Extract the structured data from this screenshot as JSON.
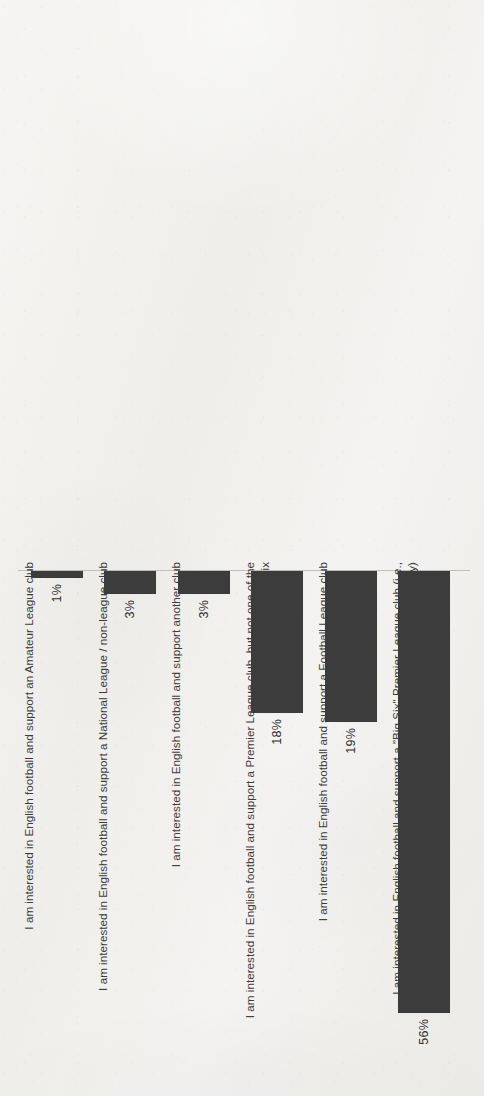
{
  "chart_data": {
    "type": "bar",
    "title": "",
    "subtitle": "",
    "xlabel": "",
    "ylabel": "",
    "orientation": "vertical-rotated-90ccw",
    "grid": false,
    "legend": null,
    "axis_range": [
      0,
      60
    ],
    "value_suffix": "%",
    "categories": [
      "I am interested in English football and support an Amateur League club",
      "I am interested in English football and support a National League / non-league club",
      "I am interested in English football and support another club",
      "I am interested in English football and support a Premier League club, but not one of the Big Six",
      "I am interested in English football and support a Football League club",
      "I am interested in English football and support a \"Big Six\" Premier League club (i.e., Manchester United, Liverpool, Arsenal, Chelsea, Tottenham, Manchester City)"
    ],
    "values": [
      1,
      3,
      3,
      18,
      19,
      56
    ],
    "value_labels": [
      "1%",
      "3%",
      "3%",
      "18%",
      "19%",
      "56%"
    ],
    "colors": {
      "bar_fill": "#3c3c3c",
      "axis_line": "#c0bfbc",
      "text": "#3b3b3b",
      "background": "#f2f1ee"
    }
  },
  "bars": [
    {
      "index": 0,
      "label": "I am interested in English football and support an Amateur League club",
      "value": 1,
      "value_label": "1%",
      "left": 31,
      "width": 52,
      "length": 7
    },
    {
      "index": 1,
      "label": "I am interested in English football and support a National League / non-league club",
      "value": 3,
      "value_label": "3%",
      "left": 104,
      "width": 52,
      "length": 23
    },
    {
      "index": 2,
      "label": "I am interested in English football and support another club",
      "value": 3,
      "value_label": "3%",
      "left": 178,
      "width": 52,
      "length": 23
    },
    {
      "index": 3,
      "label": "I am interested in English football and support a Premier League club, but not one of the Big Six",
      "value": 18,
      "value_label": "18%",
      "left": 251,
      "width": 52,
      "length": 142
    },
    {
      "index": 4,
      "label": "I am interested in English football and support a Football League club",
      "value": 19,
      "value_label": "19%",
      "left": 325,
      "width": 52,
      "length": 151
    },
    {
      "index": 5,
      "label": "I am interested in English football and support a \"Big Six\" Premier League club (i.e., Manchester United, Liverpool, Arsenal, Chelsea, Tottenham, Manchester City)",
      "value": 56,
      "value_label": "56%",
      "left": 398,
      "width": 52,
      "length": 442
    }
  ],
  "category_label_columns": [
    {
      "index": 0,
      "left": 22,
      "width": 70
    },
    {
      "index": 1,
      "left": 96,
      "width": 70
    },
    {
      "index": 2,
      "left": 169,
      "width": 70
    },
    {
      "index": 3,
      "left": 243,
      "width": 70
    },
    {
      "index": 4,
      "left": 316,
      "width": 70
    },
    {
      "index": 5,
      "left": 390,
      "width": 86
    }
  ]
}
